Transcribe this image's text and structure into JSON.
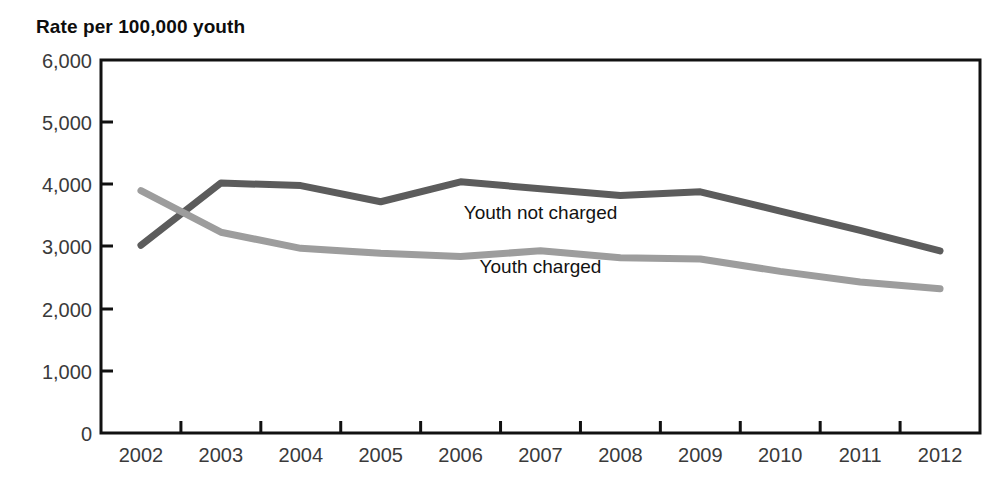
{
  "chart_data": {
    "type": "line",
    "title": "Rate per 100,000 youth",
    "xlabel": "",
    "ylabel": "Rate per 100,000 youth",
    "categories": [
      "2002",
      "2003",
      "2004",
      "2005",
      "2006",
      "2007",
      "2008",
      "2009",
      "2010",
      "2011",
      "2012"
    ],
    "x": [
      2002,
      2003,
      2004,
      2005,
      2006,
      2007,
      2008,
      2009,
      2010,
      2011,
      2012
    ],
    "ylim": [
      0,
      6000
    ],
    "xlim": [
      2002,
      2012
    ],
    "yticks": [
      0,
      1000,
      2000,
      3000,
      4000,
      5000,
      6000
    ],
    "ytick_labels": [
      "0",
      "1,000",
      "2,000",
      "3,000",
      "4,000",
      "5,000",
      "6,000"
    ],
    "grid": false,
    "legend_position": "inline-annotation",
    "series": [
      {
        "name": "Youth not charged",
        "color": "#5c5c5c",
        "values": [
          3020,
          4020,
          3980,
          3720,
          4040,
          3930,
          3820,
          3880,
          3570,
          3260,
          2930
        ]
      },
      {
        "name": "Youth charged",
        "color": "#9d9d9d",
        "values": [
          3900,
          3230,
          2970,
          2890,
          2840,
          2930,
          2820,
          2800,
          2600,
          2430,
          2320
        ]
      }
    ],
    "annotations": [
      {
        "text": "Youth not charged",
        "series": "Youth not charged",
        "x": 2007,
        "y": 3450
      },
      {
        "text": "Youth charged",
        "series": "Youth charged",
        "x": 2007,
        "y": 2580
      }
    ]
  },
  "colors": {
    "axis": "#111111",
    "tick_label": "#3a3a3a",
    "title": "#0d0d0d",
    "background": "#ffffff",
    "series_not_charged": "#5c5c5c",
    "series_charged": "#9d9d9d"
  }
}
